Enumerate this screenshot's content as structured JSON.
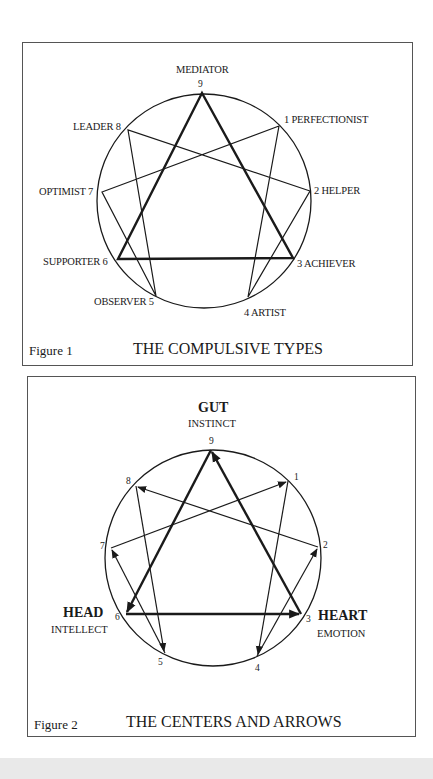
{
  "figure1": {
    "label": "Figure 1",
    "title": "THE COMPULSIVE TYPES",
    "types": {
      "t9": "MEDIATOR",
      "t9_num": "9",
      "t1": "1 PERFECTIONIST",
      "t2": "2  HELPER",
      "t3": "3 ACHIEVER",
      "t4": "4 ARTIST",
      "t5": "OBSERVER 5",
      "t6": "SUPPORTER 6",
      "t7": "OPTIMIST 7",
      "t8": "LEADER 8"
    }
  },
  "figure2": {
    "label": "Figure 2",
    "title": "THE CENTERS AND ARROWS",
    "centers": {
      "gut": {
        "title": "GUT",
        "sub": "INSTINCT"
      },
      "head": {
        "title": "HEAD",
        "sub": "INTELLECT"
      },
      "heart": {
        "title": "HEART",
        "sub": "EMOTION"
      }
    },
    "numbers": {
      "n1": "1",
      "n2": "2",
      "n3": "3",
      "n4": "4",
      "n5": "5",
      "n6": "6",
      "n7": "7",
      "n8": "8",
      "n9": "9"
    },
    "arrows": [
      {
        "from": 3,
        "to": 9
      },
      {
        "from": 9,
        "to": 6
      },
      {
        "from": 6,
        "to": 3
      },
      {
        "from": 1,
        "to": 4
      },
      {
        "from": 4,
        "to": 2
      },
      {
        "from": 2,
        "to": 8
      },
      {
        "from": 8,
        "to": 5
      },
      {
        "from": 5,
        "to": 7
      },
      {
        "from": 7,
        "to": 1
      }
    ]
  },
  "colors": {
    "line": "#1a1a1a",
    "border": "#555555",
    "background": "#ffffff"
  }
}
